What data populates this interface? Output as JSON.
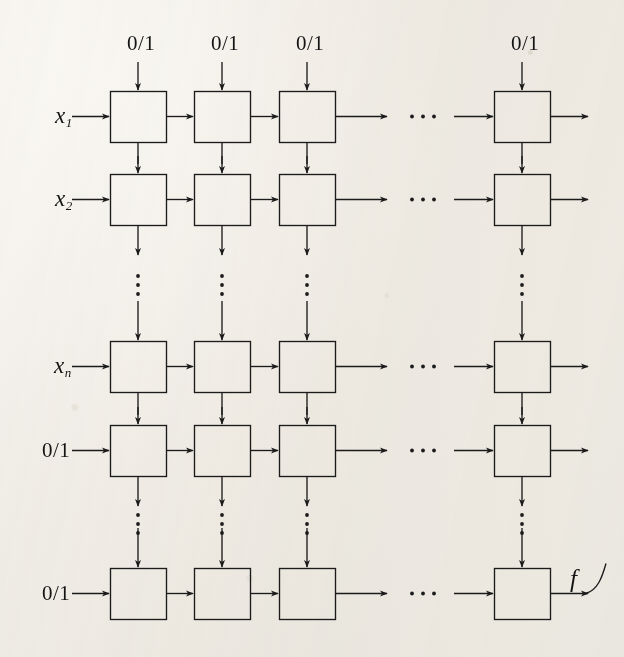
{
  "figure": {
    "background_color": "#f3f1ec",
    "line_color": "#1b1b1b",
    "grid": {
      "box_rows": 5,
      "box_columns": 4,
      "box_width": 56,
      "box_height": 51,
      "column_x": [
        110,
        194,
        279,
        494
      ],
      "row_y": [
        91,
        174,
        341,
        425,
        568
      ],
      "row_vertical_ellipsis_after": [
        2,
        4
      ],
      "column_horizontal_ellipsis_after": 3
    }
  },
  "top_labels": [
    {
      "text": "0/1",
      "column": 1
    },
    {
      "text": "0/1",
      "column": 2
    },
    {
      "text": "0/1",
      "column": 3
    },
    {
      "text": "0/1",
      "column": 4
    }
  ],
  "row_labels": [
    {
      "text": "x",
      "sub": "1",
      "italic": true,
      "row": 1
    },
    {
      "text": "x",
      "sub": "2",
      "italic": true,
      "row": 2
    },
    {
      "text": "x",
      "sub": "n",
      "italic": true,
      "row": 3
    },
    {
      "text": "0/1",
      "sub": "",
      "italic": false,
      "row": 4
    },
    {
      "text": "0/1",
      "sub": "",
      "italic": false,
      "row": 5
    }
  ],
  "output_label": {
    "text": "f",
    "italic": true
  },
  "ellipsis": {
    "horizontal": "···",
    "vertical": "⋮"
  }
}
